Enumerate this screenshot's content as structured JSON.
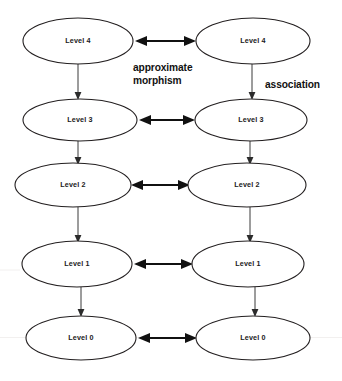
{
  "diagram": {
    "canvas": {
      "width": 342,
      "height": 381,
      "background": "#ffffff"
    },
    "colors": {
      "ellipse_stroke": "#231f20",
      "ellipse_fill": "#ffffff",
      "node_text": "#1a1a1a",
      "edge_label_text": "#111111",
      "horizontal_arrow": "#111111",
      "vertical_arrow": "#3a3a3a"
    },
    "columns": [
      {
        "name": "left-column",
        "x_center": 78
      },
      {
        "name": "right-column",
        "x_center": 249
      }
    ],
    "nodes": [
      {
        "id": "left-level-4",
        "label": "Level 4",
        "column": "left",
        "cx": 78,
        "cy": 41,
        "rx": 55,
        "ry": 23
      },
      {
        "id": "right-level-4",
        "label": "Level 4",
        "column": "right",
        "cx": 253,
        "cy": 41,
        "rx": 57,
        "ry": 23
      },
      {
        "id": "left-level-3",
        "label": "Level 3",
        "column": "left",
        "cx": 80,
        "cy": 120,
        "rx": 57,
        "ry": 21
      },
      {
        "id": "right-level-3",
        "label": "Level 3",
        "column": "right",
        "cx": 251,
        "cy": 120,
        "rx": 56,
        "ry": 21
      },
      {
        "id": "left-level-2",
        "label": "Level 2",
        "column": "left",
        "cx": 73,
        "cy": 185,
        "rx": 58,
        "ry": 22
      },
      {
        "id": "right-level-2",
        "label": "Level 2",
        "column": "right",
        "cx": 247,
        "cy": 185,
        "rx": 59,
        "ry": 22
      },
      {
        "id": "left-level-1",
        "label": "Level 1",
        "column": "left",
        "cx": 77,
        "cy": 264,
        "rx": 55,
        "ry": 23
      },
      {
        "id": "right-level-1",
        "label": "Level 1",
        "column": "right",
        "cx": 248,
        "cy": 264,
        "rx": 56,
        "ry": 23
      },
      {
        "id": "left-level-0",
        "label": "Level 0",
        "column": "left",
        "cx": 81,
        "cy": 338,
        "rx": 55,
        "ry": 22
      },
      {
        "id": "right-level-0",
        "label": "Level 0",
        "column": "right",
        "cx": 253,
        "cy": 338,
        "rx": 57,
        "ry": 22
      }
    ],
    "horizontal_edges": [
      {
        "id": "link-level-4",
        "from": "left-level-4",
        "to": "right-level-4",
        "type": "double-arrow",
        "x1": 136,
        "x2": 195,
        "y": 41
      },
      {
        "id": "link-level-3",
        "from": "left-level-3",
        "to": "right-level-3",
        "type": "double-arrow",
        "x1": 139,
        "x2": 194,
        "y": 120
      },
      {
        "id": "link-level-2",
        "from": "left-level-2",
        "to": "right-level-2",
        "type": "double-arrow",
        "x1": 132,
        "x2": 189,
        "y": 185
      },
      {
        "id": "link-level-1",
        "from": "left-level-1",
        "to": "right-level-1",
        "type": "double-arrow",
        "x1": 134,
        "x2": 192,
        "y": 264
      },
      {
        "id": "link-level-0",
        "from": "left-level-0",
        "to": "right-level-0",
        "type": "double-arrow",
        "x1": 138,
        "x2": 196,
        "y": 338
      }
    ],
    "vertical_edges": [
      {
        "id": "left-4-to-3",
        "from": "left-level-4",
        "to": "left-level-3",
        "type": "single-arrow",
        "x": 78,
        "y1": 64,
        "y2": 99
      },
      {
        "id": "right-4-to-3",
        "from": "right-level-4",
        "to": "right-level-3",
        "type": "single-arrow",
        "x": 252,
        "y1": 64,
        "y2": 99
      },
      {
        "id": "left-3-to-2",
        "from": "left-level-3",
        "to": "left-level-2",
        "type": "single-arrow",
        "x": 78,
        "y1": 141,
        "y2": 164
      },
      {
        "id": "right-3-to-2",
        "from": "right-level-3",
        "to": "right-level-2",
        "type": "single-arrow",
        "x": 250,
        "y1": 141,
        "y2": 164
      },
      {
        "id": "left-2-to-1",
        "from": "left-level-2",
        "to": "left-level-1",
        "type": "single-arrow",
        "x": 78,
        "y1": 207,
        "y2": 242
      },
      {
        "id": "right-2-to-1",
        "from": "right-level-2",
        "to": "right-level-1",
        "type": "single-arrow",
        "x": 250,
        "y1": 207,
        "y2": 242
      },
      {
        "id": "left-1-to-0",
        "from": "left-level-1",
        "to": "left-level-0",
        "type": "single-arrow",
        "x": 81,
        "y1": 287,
        "y2": 316
      },
      {
        "id": "right-1-to-0",
        "from": "right-level-1",
        "to": "right-level-0",
        "type": "single-arrow",
        "x": 255,
        "y1": 287,
        "y2": 316
      }
    ],
    "edge_labels": [
      {
        "id": "approximate-morphism-label",
        "lines": [
          "approximate",
          "morphism"
        ],
        "line1": "approximate",
        "line2": "morphism",
        "x": 133,
        "y1": 71,
        "y2": 84,
        "describes": "horizontal double arrows between left and right columns"
      },
      {
        "id": "association-label",
        "lines": [
          "association"
        ],
        "line1": "association",
        "x": 265,
        "y1": 88,
        "describes": "vertical arrows down each column"
      }
    ]
  }
}
